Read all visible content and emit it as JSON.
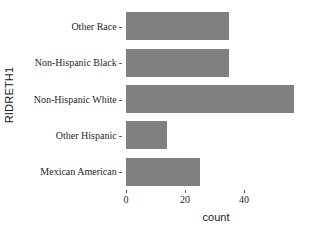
{
  "chart_data": {
    "type": "bar",
    "orientation": "horizontal",
    "title": "",
    "xlabel": "count",
    "ylabel": "RIDRETH1",
    "categories": [
      "Other Race",
      "Non-Hispanic Black",
      "Non-Hispanic White",
      "Other Hispanic",
      "Mexican American"
    ],
    "values": [
      35,
      35,
      57,
      14,
      25
    ],
    "xlim": [
      0,
      61
    ],
    "xticks": [
      0,
      20,
      40
    ],
    "xtick_labels": [
      "0",
      "20",
      "40"
    ],
    "grid": false,
    "legend": false,
    "bar_color": "#808080"
  },
  "axis": {
    "y_title": "RIDRETH1",
    "x_title": "count",
    "tick_dash": "-"
  }
}
